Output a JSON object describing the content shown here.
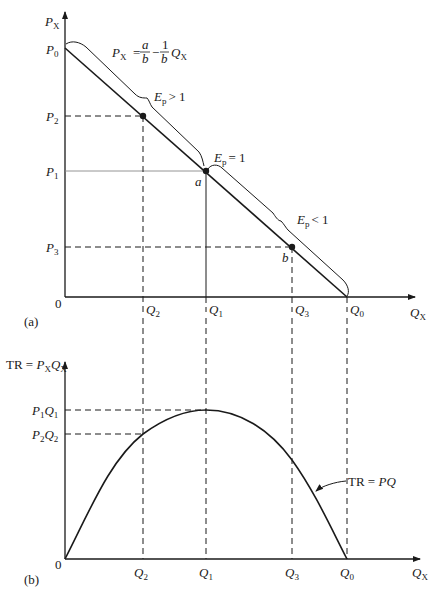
{
  "panel_a": {
    "tag": "(a)",
    "y_axis_label_main": "P",
    "y_axis_label_sub": "X",
    "x_axis_label_main": "Q",
    "x_axis_label_sub": "X",
    "origin": "0",
    "demand_equation": {
      "lhs_main": "P",
      "lhs_sub": "X",
      "eq": "=",
      "frac1_num": "a",
      "frac1_den": "b",
      "minus": "−",
      "frac2_num": "1",
      "frac2_den": "b",
      "rhs_main": "Q",
      "rhs_sub": "X"
    },
    "price_ticks": [
      {
        "main": "P",
        "sub": "0"
      },
      {
        "main": "P",
        "sub": "2"
      },
      {
        "main": "P",
        "sub": "1"
      },
      {
        "main": "P",
        "sub": "3"
      }
    ],
    "quantity_ticks": [
      {
        "main": "Q",
        "sub": "2"
      },
      {
        "main": "Q",
        "sub": "1"
      },
      {
        "main": "Q",
        "sub": "3"
      },
      {
        "main": "Q",
        "sub": "0"
      }
    ],
    "elasticity_labels": [
      {
        "main": "E",
        "sub": "p",
        "rel": "> 1"
      },
      {
        "main": "E",
        "sub": "p",
        "rel": "= 1"
      },
      {
        "main": "E",
        "sub": "p",
        "rel": "< 1"
      }
    ],
    "points": [
      {
        "label": "a"
      },
      {
        "label": "b"
      }
    ]
  },
  "panel_b": {
    "tag": "(b)",
    "y_axis_label": {
      "prefix": "TR = ",
      "p_main": "P",
      "p_sub": "X",
      "q_main": "Q",
      "q_sub": "X"
    },
    "x_axis_label_main": "Q",
    "x_axis_label_sub": "X",
    "origin": "0",
    "tr_ticks": [
      {
        "p": "P",
        "p_sub": "1",
        "q": "Q",
        "q_sub": "1"
      },
      {
        "p": "P",
        "p_sub": "2",
        "q": "Q",
        "q_sub": "2"
      }
    ],
    "quantity_ticks": [
      {
        "main": "Q",
        "sub": "2"
      },
      {
        "main": "Q",
        "sub": "1"
      },
      {
        "main": "Q",
        "sub": "3"
      },
      {
        "main": "Q",
        "sub": "0"
      }
    ],
    "curve_label": {
      "prefix": "TR = ",
      "formula": "PQ"
    }
  },
  "colors": {
    "ink": "#1a1a1a",
    "background": "#ffffff"
  }
}
